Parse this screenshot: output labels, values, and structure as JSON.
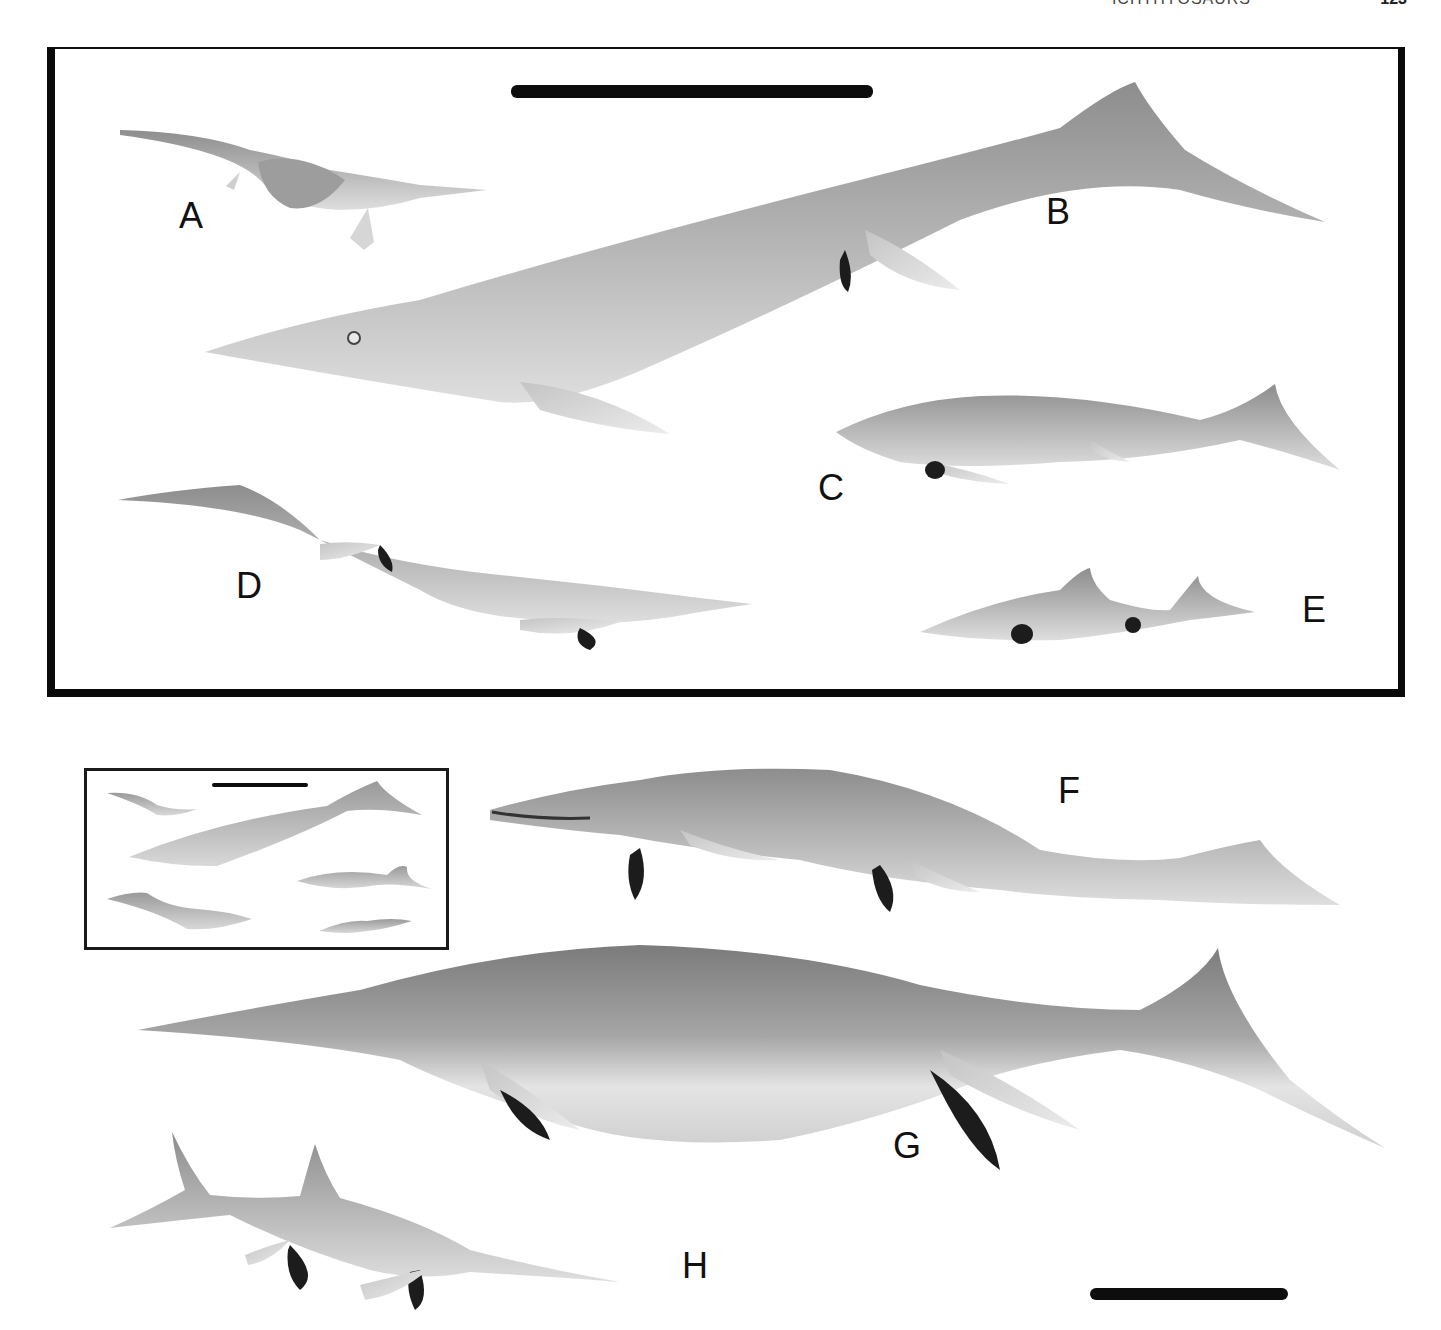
{
  "page": {
    "running_header": "ICHTHYOSAURS",
    "page_number": "123",
    "header_visible": "cropped"
  },
  "figure": {
    "type": "paleontological reconstruction plate",
    "colors": {
      "ink": "#0a0a0a",
      "skin_light": "#d9d9d9",
      "skin_mid": "#a8a8a8",
      "skin_dark": "#6e6e6e",
      "shadow_fin": "#1c1c1c",
      "background": "#ffffff"
    },
    "top_panel": {
      "scale_bar": {
        "visible": true
      },
      "specimens": [
        {
          "label": "A",
          "description": "small lizard-like early ichthyosauromorph with limbs"
        },
        {
          "label": "B",
          "description": "very large long-snouted ichthyosaur with crescent tail"
        },
        {
          "label": "C",
          "description": "medium ichthyosaur, spotted flank"
        },
        {
          "label": "D",
          "description": "long-tailed ichthyosaur with pale belly"
        },
        {
          "label": "E",
          "description": "small dolphin-shaped ichthyosaur with dorsal fin"
        }
      ]
    },
    "inset": {
      "description": "miniature copy of top panel for scale comparison",
      "scale_bar": {
        "visible": true
      }
    },
    "bottom_panel": {
      "scale_bar": {
        "visible": true
      },
      "specimens": [
        {
          "label": "F",
          "description": "large toothed ichthyosaur with open jaw"
        },
        {
          "label": "G",
          "description": "giant deep-bodied ichthyosaur"
        },
        {
          "label": "H",
          "description": "swordfish-like ichthyosaur with elongated upper jaw"
        }
      ]
    }
  }
}
